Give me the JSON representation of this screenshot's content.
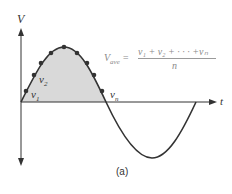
{
  "diagram": {
    "y_axis_label": "V",
    "x_axis_label": "t",
    "samples": {
      "first": "v",
      "first_sub": "1",
      "second": "v",
      "second_sub": "2",
      "last": "v",
      "last_sub": "n"
    },
    "formula": {
      "lhs": "V",
      "lhs_sub": "ave",
      "equals": " =",
      "numerator": "v₁ + v₂ + · · · +vₙ",
      "denominator": "n"
    },
    "caption": "(a)",
    "colors": {
      "curve": "#333333",
      "fill": "#d9d9d9",
      "points": "#333333",
      "formula_text": "#8a8a8a"
    }
  }
}
